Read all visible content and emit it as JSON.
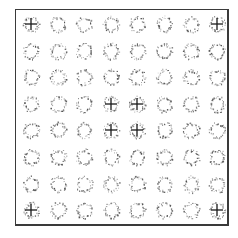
{
  "figure": {
    "rows": 8,
    "cols": 8,
    "frame_color": "#3a3a3a",
    "dot_color": "#4a4a4a",
    "crosshair_color": "#1a1a1a",
    "crosshair_cells": [
      [
        0,
        0
      ],
      [
        0,
        7
      ],
      [
        3,
        3
      ],
      [
        3,
        4
      ],
      [
        4,
        3
      ],
      [
        4,
        4
      ],
      [
        7,
        0
      ],
      [
        7,
        7
      ]
    ]
  }
}
